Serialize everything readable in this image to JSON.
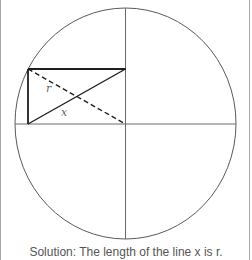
{
  "diagram": {
    "labels": {
      "r": "r",
      "x": "x"
    },
    "caption": "Solution: The length of the line x is r.",
    "colors": {
      "circle": "#5a5a5a",
      "axes": "#6a6a6a",
      "rectangle": "#1e1e1e",
      "label": "#666666",
      "caption": "#555555",
      "frame_border": "#a8a8a8"
    }
  }
}
